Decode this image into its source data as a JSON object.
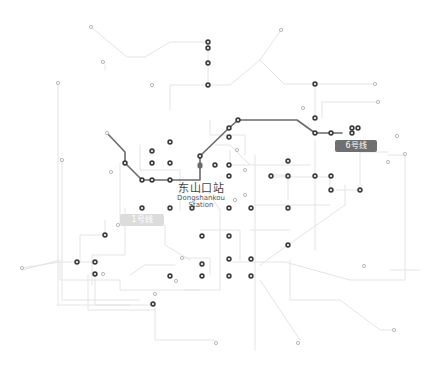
{
  "map": {
    "title_station": {
      "name_zh": "东山口站",
      "name_en_line1": "Dongshankou",
      "name_en_line2": "Station"
    },
    "line_badges": [
      {
        "id": "line-1",
        "label": "1号线",
        "color": "#dcdcdc",
        "x": 120,
        "y": 214,
        "w": 44
      },
      {
        "id": "line-6",
        "label": "6号线",
        "color": "#6f6f6f",
        "x": 335,
        "y": 140,
        "w": 42
      }
    ],
    "colors": {
      "background": "#ffffff",
      "network_line": "#e4e4e4",
      "highlight_line": "#6a6a6a",
      "station_stroke": "#3c3c3c",
      "minor_station": "#b8b8b8"
    }
  }
}
